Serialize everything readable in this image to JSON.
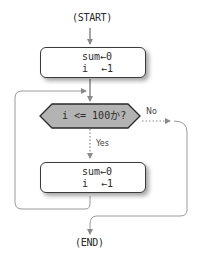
{
  "diagram": {
    "type": "flowchart",
    "start": "(START)",
    "end": "(END)",
    "init_box": {
      "line1": "sum←0",
      "line2_var": "i",
      "line2_assign": "←1"
    },
    "decision": {
      "text": "i <= 100か?",
      "fill": "#b3b3b3"
    },
    "branch_no": "No",
    "branch_yes": "Yes",
    "process_box": {
      "line1": "sum←0",
      "line2_var": "i",
      "line2_assign": "←1"
    },
    "colors": {
      "arrow": "#8a8a8a",
      "border": "#3a3a3a",
      "loop_line": "#9a9a9a"
    }
  }
}
